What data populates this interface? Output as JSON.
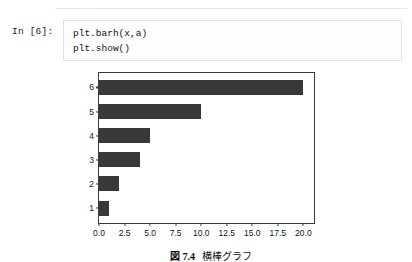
{
  "notebook": {
    "prompt_label": "In [6]:",
    "code": "plt.barh(x,a)\nplt.show()"
  },
  "caption": {
    "figure_word": "図",
    "number": "7.4",
    "text": "横棒グラフ"
  },
  "colors": {
    "bar": "#383838",
    "axis": "#3b3b3b",
    "cell_border": "#e2e2e2",
    "background": "#ffffff"
  },
  "chart_data": {
    "type": "bar",
    "orientation": "horizontal",
    "title": "",
    "xlabel": "",
    "ylabel": "",
    "categories": [
      "1",
      "2",
      "3",
      "4",
      "5",
      "6"
    ],
    "values": [
      1,
      2,
      4,
      5,
      10,
      20
    ],
    "xlim": [
      0,
      21
    ],
    "ylim": [
      0.4,
      6.6
    ],
    "xticks": [
      "0.0",
      "2.5",
      "5.0",
      "7.5",
      "10.0",
      "12.5",
      "15.0",
      "17.5",
      "20.0"
    ],
    "xtick_values": [
      0,
      2.5,
      5,
      7.5,
      10,
      12.5,
      15,
      17.5,
      20
    ],
    "yticks": [
      "1",
      "2",
      "3",
      "4",
      "5",
      "6"
    ],
    "grid": false,
    "legend": false
  }
}
